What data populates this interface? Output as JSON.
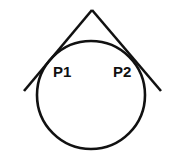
{
  "diagram": {
    "type": "circle-with-tangent-lines",
    "labels": {
      "p1": "P1",
      "p2": "P2"
    },
    "colors": {
      "stroke": "#111111",
      "background": "#ffffff"
    },
    "shapes": {
      "circle": {
        "cx": 91,
        "cy": 95,
        "r": 54
      },
      "apex": {
        "x": 92,
        "y": 10
      },
      "left_line_end": {
        "x": 24,
        "y": 91
      },
      "right_line_end": {
        "x": 161,
        "y": 91
      }
    }
  }
}
